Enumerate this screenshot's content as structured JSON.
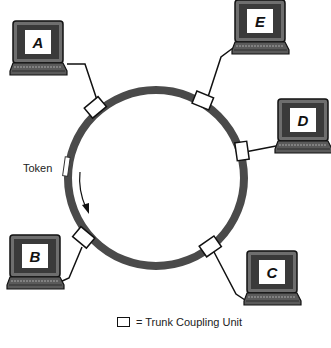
{
  "diagram": {
    "type": "token-ring-network",
    "ring": {
      "cx": 156,
      "cy": 178,
      "r": 88,
      "stroke_width": 8,
      "color": "#4a4a4a"
    },
    "token_label": "Token",
    "computers": [
      {
        "id": "A",
        "letter": "A",
        "x": 10,
        "y": 21
      },
      {
        "id": "E",
        "letter": "E",
        "x": 232,
        "y": 0
      },
      {
        "id": "D",
        "letter": "D",
        "x": 275,
        "y": 99
      },
      {
        "id": "B",
        "letter": "B",
        "x": 7,
        "y": 235
      },
      {
        "id": "C",
        "letter": "C",
        "x": 244,
        "y": 251
      }
    ],
    "legend": {
      "symbol": "rectangle",
      "text": "= Trunk Coupling Unit"
    },
    "colors": {
      "ring": "#4a4a4a",
      "screen_frame": "#6e6e6e",
      "screen_inner": "#3a3a3a",
      "screen_label_bg": "#ffffff",
      "line": "#111111"
    }
  }
}
